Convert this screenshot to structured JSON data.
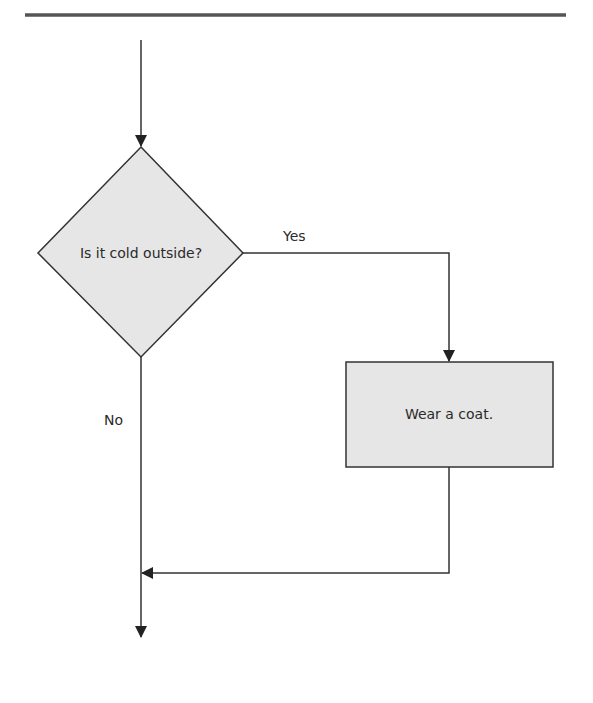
{
  "diagram": {
    "type": "flowchart",
    "decision": {
      "text": "Is it cold outside?"
    },
    "process": {
      "text": "Wear a coat."
    },
    "edges": {
      "yes_label": "Yes",
      "no_label": "No"
    },
    "colors": {
      "stroke": "#333333",
      "shape_fill": "#e6e6e6",
      "top_rule": "#555555",
      "background": "#ffffff"
    }
  }
}
